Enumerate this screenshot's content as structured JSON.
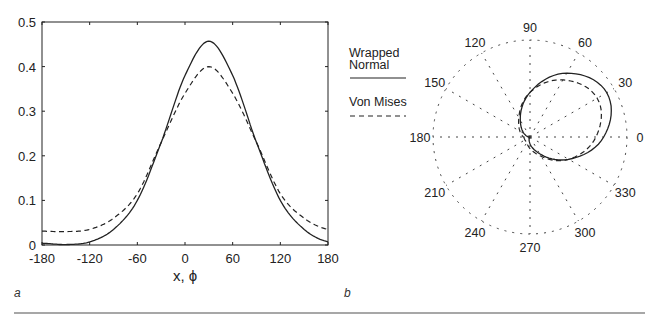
{
  "chart_data": [
    {
      "type": "line",
      "panel": "a",
      "title": "",
      "xlabel": "x, ϕ",
      "ylabel": "",
      "xlim": [
        -180,
        180
      ],
      "ylim": [
        0,
        0.5
      ],
      "xticks": [
        "-180",
        "-120",
        "-60",
        "0",
        "60",
        "120",
        "180"
      ],
      "yticks": [
        "0",
        "0.1",
        "0.2",
        "0.3",
        "0.4",
        "0.5"
      ],
      "grid": false,
      "x": [
        -180,
        -150,
        -120,
        -90,
        -60,
        -30,
        0,
        30,
        60,
        90,
        120,
        150,
        180
      ],
      "series": [
        {
          "name": "Wrapped Normal",
          "style": "solid",
          "values": [
            0.004,
            0.001,
            0.007,
            0.035,
            0.1,
            0.23,
            0.38,
            0.457,
            0.38,
            0.23,
            0.1,
            0.035,
            0.007
          ]
        },
        {
          "name": "Von Mises",
          "style": "dashed",
          "values": [
            0.031,
            0.03,
            0.035,
            0.06,
            0.115,
            0.23,
            0.34,
            0.4,
            0.34,
            0.23,
            0.115,
            0.06,
            0.035
          ]
        }
      ]
    },
    {
      "type": "line",
      "subtype": "polar",
      "panel": "b",
      "title": "",
      "angle_labels": [
        "0",
        "30",
        "60",
        "90",
        "120",
        "150",
        "180",
        "210",
        "240",
        "270",
        "300",
        "330"
      ],
      "rlim": [
        0,
        0.5
      ],
      "grid": true,
      "legend": [
        "Wrapped Normal",
        "Von Mises"
      ],
      "legend_position": "left",
      "theta": [
        -180,
        -150,
        -120,
        -90,
        -60,
        -30,
        0,
        30,
        60,
        90,
        120,
        150,
        180
      ],
      "series": [
        {
          "name": "Wrapped Normal",
          "style": "solid",
          "values": [
            0.004,
            0.001,
            0.007,
            0.035,
            0.1,
            0.23,
            0.38,
            0.457,
            0.38,
            0.23,
            0.1,
            0.035,
            0.007
          ]
        },
        {
          "name": "Von Mises",
          "style": "dashed",
          "values": [
            0.031,
            0.03,
            0.035,
            0.06,
            0.115,
            0.23,
            0.34,
            0.4,
            0.34,
            0.23,
            0.115,
            0.06,
            0.035
          ]
        }
      ]
    }
  ],
  "panels": {
    "a": {
      "label": "a",
      "xlabel": "x, ϕ"
    },
    "b": {
      "label": "b"
    }
  },
  "legend": {
    "wrapped_normal_line1": "Wrapped",
    "wrapped_normal_line2": "Normal",
    "von_mises": "Von Mises"
  },
  "colors": {
    "ink": "#222222",
    "rule": "#8a8a8a"
  }
}
